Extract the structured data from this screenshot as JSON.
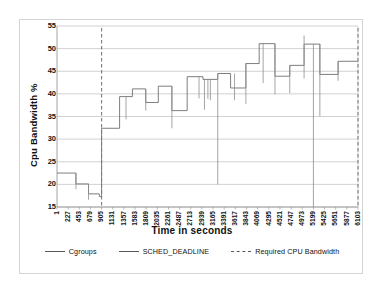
{
  "chart_data": {
    "type": "line",
    "title": "",
    "xlabel": "Time in seconds",
    "ylabel": "Cpu Bandwidth %",
    "xlim": [
      1,
      6103
    ],
    "ylim": [
      15,
      55
    ],
    "ytick_step": 5,
    "grid": "horizontal",
    "legend_position": "bottom",
    "xticks": [
      1,
      227,
      453,
      679,
      905,
      1131,
      1357,
      1583,
      1809,
      2035,
      2261,
      2487,
      2713,
      2939,
      3165,
      3391,
      3617,
      3843,
      4069,
      4295,
      4521,
      4747,
      4973,
      5199,
      5425,
      5651,
      5877,
      6103
    ],
    "yticks": [
      15,
      20,
      25,
      30,
      35,
      40,
      45,
      50,
      55
    ],
    "series": [
      {
        "name": "Cgroups",
        "style": "solid",
        "color": "#6b6b6b",
        "x": [
          1,
          227,
          453,
          679,
          905,
          1131,
          1357,
          1583,
          1809,
          2035,
          2261,
          2487,
          2713,
          2939,
          3165,
          3391,
          3617,
          3843,
          4069,
          4295,
          4521,
          4747,
          4973,
          5199,
          5425,
          5651,
          5877,
          6103
        ],
        "values": [
          22.5,
          22.5,
          20.1,
          20.1,
          17.9,
          17.9,
          32.4,
          32.4,
          39.4,
          39.4,
          41.1,
          41.1,
          38.1,
          38.1,
          41.7,
          41.7,
          36.3,
          36.3,
          43.8,
          43.8,
          43.2,
          43.2,
          44.5,
          44.5,
          41.3,
          41.3,
          46.7,
          46.7
        ]
      },
      {
        "name": "SCHED_DEADLINE",
        "style": "solid",
        "color": "#8a8a8a",
        "x": [
          1,
          227,
          453,
          679,
          905,
          1131,
          1357,
          1583,
          1809,
          2035,
          2261,
          2487,
          2713,
          2939,
          3165,
          3391,
          3617,
          3843,
          4069,
          4295,
          4521,
          4747,
          4973,
          5199,
          5425,
          5651,
          5877,
          6103
        ],
        "values": [
          22.5,
          20.1,
          17.9,
          17.3,
          32.4,
          39.4,
          41.1,
          38.1,
          41.7,
          36.3,
          43.8,
          43.2,
          43.2,
          44.5,
          41.3,
          46.7,
          51.1,
          43.9,
          46.3,
          51.0,
          44.3,
          47.2,
          47.2,
          51.0,
          44.3,
          44.3,
          47.2,
          47.2
        ]
      },
      {
        "name": "Required CPU Bandwidth",
        "style": "dashed",
        "color": "#7a7a7a",
        "x": [
          905,
          5199,
          6103
        ],
        "values": [
          15,
          15,
          15
        ]
      }
    ],
    "step_plateaus": [
      {
        "x_start": 1,
        "x_end": 385,
        "y": 22.5
      },
      {
        "x_start": 385,
        "x_end": 640,
        "y": 20.1
      },
      {
        "x_start": 640,
        "x_end": 860,
        "y": 17.9
      },
      {
        "x_start": 860,
        "x_end": 905,
        "y": 17.3
      },
      {
        "x_start": 905,
        "x_end": 1270,
        "y": 32.4
      },
      {
        "x_start": 1270,
        "x_end": 1530,
        "y": 39.4
      },
      {
        "x_start": 1530,
        "x_end": 1800,
        "y": 41.1
      },
      {
        "x_start": 1800,
        "x_end": 2055,
        "y": 38.1
      },
      {
        "x_start": 2055,
        "x_end": 2330,
        "y": 41.7
      },
      {
        "x_start": 2330,
        "x_end": 2640,
        "y": 36.3
      },
      {
        "x_start": 2640,
        "x_end": 2960,
        "y": 43.8
      },
      {
        "x_start": 2960,
        "x_end": 3260,
        "y": 43.2
      },
      {
        "x_start": 3260,
        "x_end": 3520,
        "y": 44.5
      },
      {
        "x_start": 3520,
        "x_end": 3830,
        "y": 41.3
      },
      {
        "x_start": 3830,
        "x_end": 4100,
        "y": 46.7
      },
      {
        "x_start": 4100,
        "x_end": 4420,
        "y": 51.1
      },
      {
        "x_start": 4420,
        "x_end": 4720,
        "y": 43.9
      },
      {
        "x_start": 4720,
        "x_end": 5010,
        "y": 46.3
      },
      {
        "x_start": 5010,
        "x_end": 5330,
        "y": 51.0
      },
      {
        "x_start": 5330,
        "x_end": 5700,
        "y": 44.3
      },
      {
        "x_start": 5700,
        "x_end": 6103,
        "y": 47.2
      }
    ],
    "spikes": [
      {
        "x": 385,
        "y_low": 18.9,
        "y_high": 22.5
      },
      {
        "x": 640,
        "y_low": 16.6,
        "y_high": 20.1
      },
      {
        "x": 1400,
        "y_low": 34.4,
        "y_high": 39.4
      },
      {
        "x": 1800,
        "y_low": 36.3,
        "y_high": 41.1
      },
      {
        "x": 2330,
        "y_low": 32.4,
        "y_high": 41.7
      },
      {
        "x": 2880,
        "y_low": 39.0,
        "y_high": 43.8
      },
      {
        "x": 2990,
        "y_low": 36.5,
        "y_high": 43.3
      },
      {
        "x": 3060,
        "y_low": 38.9,
        "y_high": 43.3
      },
      {
        "x": 3110,
        "y_low": 38.6,
        "y_high": 43.3
      },
      {
        "x": 3260,
        "y_low": 20.0,
        "y_high": 44.5
      },
      {
        "x": 3600,
        "y_low": 38.6,
        "y_high": 44.5
      },
      {
        "x": 3830,
        "y_low": 37.8,
        "y_high": 46.7
      },
      {
        "x": 4180,
        "y_low": 42.4,
        "y_high": 51.1
      },
      {
        "x": 4420,
        "y_low": 39.9,
        "y_high": 51.1
      },
      {
        "x": 4720,
        "y_low": 40.2,
        "y_high": 46.3
      },
      {
        "x": 5010,
        "y_low": 43.4,
        "y_high": 52.9
      },
      {
        "x": 5199,
        "y_low": 15.0,
        "y_high": 51.0
      },
      {
        "x": 5330,
        "y_low": 35.1,
        "y_high": 51.0
      },
      {
        "x": 5700,
        "y_low": 42.9,
        "y_high": 47.2
      }
    ]
  },
  "legend": {
    "items": [
      {
        "label": "Cgroups",
        "style": "solid"
      },
      {
        "label": "SCHED_DEADLINE",
        "style": "solid"
      },
      {
        "label": "Required CPU Bandwidth",
        "style": "dashed"
      }
    ]
  },
  "axes": {
    "y_title": "Cpu Bandwidth %",
    "x_title": "Time in seconds"
  }
}
